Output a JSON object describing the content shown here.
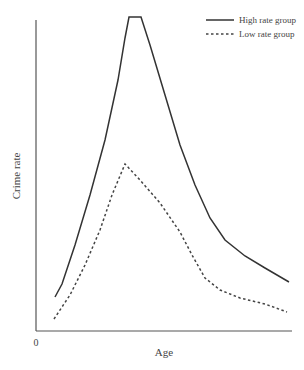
{
  "chart_data": {
    "type": "line",
    "title": "",
    "xlabel": "Age",
    "ylabel": "Crime rate",
    "x_tick_labels": [
      "0"
    ],
    "grid": false,
    "legend_position": "top-right",
    "series": [
      {
        "name": "High rate group",
        "style": "solid",
        "points_px": [
          [
            55,
            297
          ],
          [
            62,
            284
          ],
          [
            75,
            245
          ],
          [
            90,
            195
          ],
          [
            105,
            140
          ],
          [
            118,
            80
          ],
          [
            125,
            38
          ],
          [
            129,
            17
          ],
          [
            141,
            17
          ],
          [
            150,
            45
          ],
          [
            165,
            95
          ],
          [
            180,
            145
          ],
          [
            195,
            185
          ],
          [
            210,
            218
          ],
          [
            225,
            240
          ],
          [
            245,
            256
          ],
          [
            265,
            268
          ],
          [
            289,
            282
          ]
        ]
      },
      {
        "name": "Low rate group",
        "style": "dashed",
        "points_px": [
          [
            54,
            319
          ],
          [
            70,
            295
          ],
          [
            85,
            265
          ],
          [
            100,
            230
          ],
          [
            112,
            195
          ],
          [
            125,
            164
          ],
          [
            140,
            180
          ],
          [
            160,
            203
          ],
          [
            180,
            232
          ],
          [
            192,
            255
          ],
          [
            205,
            278
          ],
          [
            220,
            290
          ],
          [
            240,
            298
          ],
          [
            265,
            304
          ],
          [
            287,
            312
          ]
        ]
      }
    ]
  },
  "legend": {
    "items": [
      {
        "label": "High rate group",
        "style": "solid"
      },
      {
        "label": "Low rate group",
        "style": "dashed"
      }
    ]
  },
  "axes": {
    "x_label": "Age",
    "y_label": "Crime rate",
    "origin_label": "0"
  }
}
